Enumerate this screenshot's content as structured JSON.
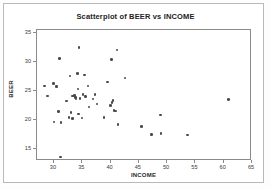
{
  "chart_data": {
    "type": "scatter",
    "title": "Scatterplot of BEER vs INCOME",
    "xlabel": "INCOME",
    "ylabel": "BEER",
    "xlim": [
      27.0,
      65.0
    ],
    "ylim": [
      13.0,
      35.5
    ],
    "xticks": [
      30,
      35,
      40,
      45,
      50,
      55,
      60,
      65
    ],
    "yticks": [
      15,
      20,
      25,
      30,
      35
    ],
    "grid": false,
    "legend": false,
    "marker_color": "#4a4a4a",
    "series": [
      {
        "name": "BEER vs INCOME",
        "points": [
          [
            28.5,
            25.7
          ],
          [
            29.0,
            24.0
          ],
          [
            30.1,
            26.1
          ],
          [
            30.2,
            19.5
          ],
          [
            30.6,
            25.6
          ],
          [
            31.0,
            21.3
          ],
          [
            31.2,
            30.4
          ],
          [
            31.4,
            19.4
          ],
          [
            31.3,
            13.5
          ],
          [
            32.4,
            23.1
          ],
          [
            32.8,
            20.3
          ],
          [
            33.0,
            27.4
          ],
          [
            33.2,
            21.2
          ],
          [
            33.4,
            24.0
          ],
          [
            33.5,
            20.1
          ],
          [
            33.8,
            24.1
          ],
          [
            34.0,
            23.7
          ],
          [
            34.1,
            23.5
          ],
          [
            34.3,
            27.9
          ],
          [
            34.4,
            25.2
          ],
          [
            34.5,
            20.9
          ],
          [
            34.6,
            32.3
          ],
          [
            34.8,
            23.6
          ],
          [
            35.1,
            20.2
          ],
          [
            35.3,
            24.2
          ],
          [
            35.6,
            27.6
          ],
          [
            35.8,
            23.9
          ],
          [
            36.2,
            25.7
          ],
          [
            36.4,
            22.1
          ],
          [
            37.1,
            23.5
          ],
          [
            37.4,
            24.3
          ],
          [
            37.8,
            22.6
          ],
          [
            39.0,
            20.3
          ],
          [
            39.6,
            26.4
          ],
          [
            40.2,
            22.4
          ],
          [
            40.3,
            30.3
          ],
          [
            40.4,
            22.9
          ],
          [
            40.6,
            23.2
          ],
          [
            40.8,
            21.5
          ],
          [
            41.0,
            21.4
          ],
          [
            41.3,
            31.9
          ],
          [
            41.5,
            19.1
          ],
          [
            42.7,
            27.1
          ],
          [
            45.6,
            18.8
          ],
          [
            47.4,
            17.4
          ],
          [
            49.0,
            20.7
          ],
          [
            49.1,
            17.6
          ],
          [
            53.8,
            17.3
          ],
          [
            61.0,
            23.4
          ]
        ]
      }
    ]
  }
}
